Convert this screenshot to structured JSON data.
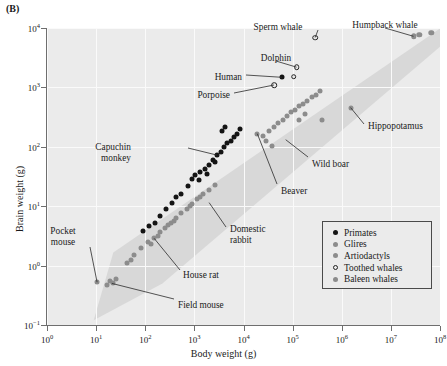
{
  "panel_label": "(B)",
  "chart_data": {
    "type": "scatter",
    "title": "",
    "xlabel": "Body weight (g)",
    "ylabel": "Brain weight (g)",
    "xlim": [
      0,
      8
    ],
    "ylim": [
      -1,
      4
    ],
    "xscale": "log10",
    "yscale": "log10",
    "xticks": [
      "10⁰",
      "10¹",
      "10²",
      "10³",
      "10⁴",
      "10⁵",
      "10⁶",
      "10⁷",
      "10⁸"
    ],
    "yticks": [
      "10⁻¹",
      "10⁰",
      "10¹",
      "10²",
      "10³",
      "10⁴"
    ],
    "xtick_exponents": [
      0,
      1,
      2,
      3,
      4,
      5,
      6,
      7,
      8
    ],
    "ytick_exponents": [
      -1,
      0,
      1,
      2,
      3,
      4
    ],
    "grid": true,
    "legend_position": "lower right",
    "shaded_band": {
      "description": "grey allometric scatter envelope from lower-left to upper-right",
      "points": [
        [
          0.95,
          -0.92
        ],
        [
          1.35,
          0.22
        ],
        [
          8.05,
          4.02
        ],
        [
          8.05,
          3.72
        ],
        [
          2.35,
          -0.3
        ]
      ]
    },
    "series": [
      {
        "name": "Primates",
        "marker": "filled-circle",
        "color": "#141414",
        "points": [
          [
            2.2,
            0.72
          ],
          [
            2.42,
            0.95
          ],
          [
            2.55,
            1.06
          ],
          [
            2.62,
            1.16
          ],
          [
            2.72,
            1.2
          ],
          [
            2.86,
            1.34
          ],
          [
            2.95,
            1.46
          ],
          [
            3.02,
            1.52
          ],
          [
            3.12,
            1.58
          ],
          [
            3.22,
            1.62
          ],
          [
            3.3,
            1.7
          ],
          [
            3.38,
            1.78
          ],
          [
            3.46,
            1.86
          ],
          [
            3.54,
            1.92
          ],
          [
            3.6,
            2.0
          ],
          [
            3.66,
            2.06
          ],
          [
            3.74,
            2.1
          ],
          [
            3.8,
            2.16
          ],
          [
            3.86,
            2.22
          ],
          [
            3.92,
            2.3
          ],
          [
            1.95,
            0.58
          ],
          [
            2.08,
            0.66
          ],
          [
            2.3,
            0.84
          ],
          [
            3.1,
            1.44
          ],
          [
            3.26,
            1.54
          ],
          [
            3.42,
            1.74
          ],
          [
            3.56,
            2.26
          ],
          [
            3.62,
            2.34
          ],
          [
            4.78,
            3.17
          ]
        ]
      },
      {
        "name": "Glires",
        "marker": "filled-circle",
        "color": "#8c8c8c",
        "points": [
          [
            1.02,
            -0.28
          ],
          [
            1.22,
            -0.32
          ],
          [
            1.28,
            -0.26
          ],
          [
            1.34,
            -0.3
          ],
          [
            1.4,
            -0.22
          ],
          [
            1.78,
            0.18
          ],
          [
            1.92,
            0.3
          ],
          [
            2.06,
            0.4
          ],
          [
            2.18,
            0.46
          ],
          [
            2.3,
            0.56
          ],
          [
            2.4,
            0.64
          ],
          [
            2.52,
            0.72
          ],
          [
            2.62,
            0.8
          ],
          [
            2.72,
            0.88
          ],
          [
            2.84,
            0.96
          ],
          [
            2.96,
            1.04
          ],
          [
            3.06,
            1.12
          ],
          [
            3.18,
            1.2
          ],
          [
            3.3,
            1.28
          ],
          [
            3.42,
            1.36
          ],
          [
            1.62,
            0.04
          ],
          [
            1.7,
            0.1
          ],
          [
            2.12,
            0.36
          ],
          [
            2.26,
            0.5
          ],
          [
            2.46,
            0.68
          ],
          [
            2.58,
            0.76
          ],
          [
            2.9,
            1.0
          ],
          [
            3.12,
            1.16
          ],
          [
            4.28,
            2.22
          ]
        ]
      },
      {
        "name": "Artiodactyls",
        "marker": "filled-circle",
        "color": "#8c8c8c",
        "points": [
          [
            4.4,
            2.18
          ],
          [
            4.52,
            2.26
          ],
          [
            4.62,
            2.34
          ],
          [
            4.7,
            2.4
          ],
          [
            4.8,
            2.46
          ],
          [
            4.88,
            2.52
          ],
          [
            4.96,
            2.58
          ],
          [
            5.04,
            2.62
          ],
          [
            5.12,
            2.68
          ],
          [
            5.2,
            2.72
          ],
          [
            5.3,
            2.78
          ],
          [
            5.4,
            2.84
          ],
          [
            5.48,
            2.88
          ],
          [
            5.56,
            2.94
          ],
          [
            4.46,
            2.1
          ],
          [
            4.58,
            2.02
          ],
          [
            5.12,
            2.46
          ],
          [
            5.26,
            2.56
          ],
          [
            5.6,
            2.46
          ],
          [
            6.18,
            2.66
          ]
        ]
      },
      {
        "name": "Toothed whales",
        "marker": "open-circle",
        "color": "#222222",
        "points": [
          [
            4.62,
            3.04
          ],
          [
            5.02,
            3.18
          ],
          [
            5.08,
            3.34
          ],
          [
            5.46,
            3.84
          ]
        ]
      },
      {
        "name": "Baleen whales",
        "marker": "filled-circle",
        "color": "#8c8c8c",
        "points": [
          [
            7.46,
            3.86
          ],
          [
            7.58,
            3.88
          ],
          [
            7.82,
            3.92
          ]
        ]
      }
    ],
    "annotations": [
      {
        "label": "Sperm whale",
        "point": [
          5.46,
          3.84
        ]
      },
      {
        "label": "Humpback whale",
        "point": [
          7.46,
          3.86
        ]
      },
      {
        "label": "Dolphin",
        "point": [
          5.08,
          3.34
        ]
      },
      {
        "label": "Human",
        "point": [
          4.78,
          3.17
        ]
      },
      {
        "label": "Porpoise",
        "point": [
          4.62,
          3.04
        ]
      },
      {
        "label": "Hippopotamus",
        "point": [
          6.18,
          2.66
        ]
      },
      {
        "label": "Wild boar",
        "point": [
          4.86,
          2.12
        ]
      },
      {
        "label": "Capuchin monkey",
        "point": [
          3.46,
          1.86
        ]
      },
      {
        "label": "Beaver",
        "point": [
          4.28,
          2.22
        ]
      },
      {
        "label": "Domestic rabbit",
        "point": [
          3.3,
          1.06
        ]
      },
      {
        "label": "House rat",
        "point": [
          2.18,
          0.46
        ]
      },
      {
        "label": "Pocket mouse",
        "point": [
          1.02,
          -0.28
        ]
      },
      {
        "label": "Field mouse",
        "point": [
          1.32,
          -0.3
        ]
      }
    ]
  },
  "legend": {
    "items": [
      {
        "label": "Primates",
        "marker": "primate"
      },
      {
        "label": "Glires",
        "marker": "glire"
      },
      {
        "label": "Artiodactyls",
        "marker": "artio"
      },
      {
        "label": "Toothed whales",
        "marker": "toothed"
      },
      {
        "label": "Baleen whales",
        "marker": "baleen"
      }
    ]
  },
  "annotation_text": {
    "sperm_whale": "Sperm whale",
    "humpback_whale": "Humpback whale",
    "dolphin": "Dolphin",
    "human": "Human",
    "porpoise": "Porpoise",
    "hippopotamus": "Hippopotamus",
    "wild_boar": "Wild boar",
    "capuchin_line1": "Capuchin",
    "capuchin_line2": "monkey",
    "beaver": "Beaver",
    "rabbit_line1": "Domestic",
    "rabbit_line2": "rabbit",
    "house_rat": "House rat",
    "pocket_line1": "Pocket",
    "pocket_line2": "mouse",
    "field_mouse": "Field mouse"
  }
}
